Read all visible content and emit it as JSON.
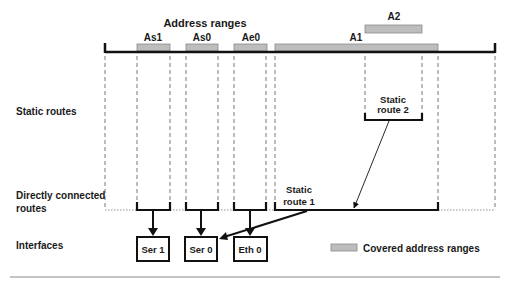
{
  "header": {
    "title": "Address ranges"
  },
  "ranges": [
    {
      "label": "As1",
      "x1": 137,
      "x2": 170
    },
    {
      "label": "As0",
      "x1": 186,
      "x2": 218
    },
    {
      "label": "Ae0",
      "x1": 234,
      "x2": 267
    },
    {
      "label": "A1",
      "x1": 275,
      "x2": 438
    },
    {
      "label": "A2",
      "x1": 365,
      "x2": 422
    }
  ],
  "row_labels": {
    "static_routes": "Static routes",
    "direct_line1": "Directly connected",
    "direct_line2": "routes",
    "interfaces": "Interfaces"
  },
  "static_route_2": {
    "line1": "Static",
    "line2": "route 2"
  },
  "static_route_1": {
    "line1": "Static",
    "line2": "route 1"
  },
  "interfaces": [
    {
      "label": "Ser 1"
    },
    {
      "label": "Ser 0"
    },
    {
      "label": "Eth 0"
    }
  ],
  "legend": {
    "label": "Covered address ranges",
    "swatch_color": "#bdbdbd"
  },
  "colors": {
    "bar_fill": "#bdbdbd",
    "bar_stroke": "#8a8a8a",
    "line": "#111111",
    "dash": "#555555"
  }
}
